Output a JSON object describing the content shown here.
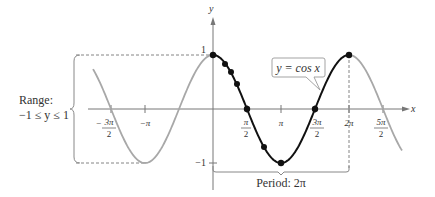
{
  "figure": {
    "function_label": "y = cos x",
    "axes": {
      "x_label": "x",
      "y_label": "y"
    },
    "y_ticks": [
      {
        "value": 1,
        "label": "1"
      },
      {
        "value": -1,
        "label": "−1"
      }
    ],
    "x_ticks": [
      {
        "value": "-3pi/2",
        "num": "3π",
        "den": "2",
        "sign": "−"
      },
      {
        "value": "-pi",
        "label": "−π"
      },
      {
        "value": "pi/2",
        "num": "π",
        "den": "2"
      },
      {
        "value": "pi",
        "label": "π"
      },
      {
        "value": "3pi/2",
        "num": "3π",
        "den": "2"
      },
      {
        "value": "2pi",
        "label": "2π"
      },
      {
        "value": "5pi/2",
        "num": "5π",
        "den": "2"
      }
    ],
    "range_label": "Range:",
    "range_value": "−1 ≤ y ≤ 1",
    "period_label": "Period: 2π",
    "key_points": [
      {
        "x": "0",
        "y": 1
      },
      {
        "x": "pi/2",
        "y": 0
      },
      {
        "x": "pi",
        "y": -1
      },
      {
        "x": "3pi/2",
        "y": 0
      },
      {
        "x": "2pi",
        "y": 1
      }
    ],
    "colors": {
      "one_period": "#111111",
      "extended_curve": "#a8a8a8",
      "axis": "#777777"
    }
  }
}
